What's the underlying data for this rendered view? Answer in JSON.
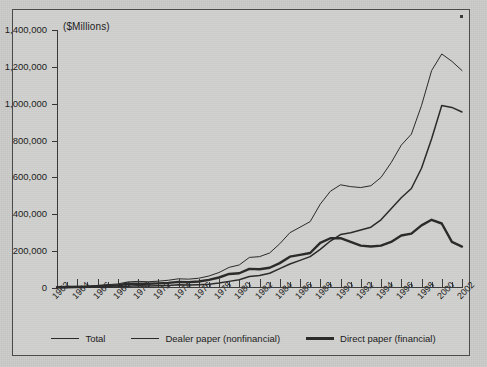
{
  "figure": {
    "background_color": "#cbcbc9",
    "frame_color": "#4b4b4b",
    "axis_color": "#3a3a3a",
    "line_color": "#2b2b2b"
  },
  "chart_data": {
    "type": "line",
    "title": "",
    "subtitle": "",
    "ylabel": "($Millions)",
    "xlabel": "",
    "grid": false,
    "legend_position": "bottom",
    "ylim": [
      0,
      1400000
    ],
    "ytick_values": [
      0,
      200000,
      400000,
      600000,
      800000,
      1000000,
      1200000,
      1400000
    ],
    "ytick_labels": [
      "0",
      "200,000",
      "400,000",
      "600,000",
      "800,000",
      "1,000,000",
      "1,200,000",
      "1,400,000"
    ],
    "xlim": [
      1962,
      2002
    ],
    "xtick_labels": [
      "1962",
      "1964",
      "1966",
      "1968",
      "1970",
      "1972",
      "1974",
      "1976",
      "1978",
      "1980",
      "1982",
      "1984",
      "1986",
      "1988",
      "1990",
      "1992",
      "1994",
      "1996",
      "1998",
      "2000",
      "2002"
    ],
    "x_minor_tick_interval": 1,
    "x": [
      1962,
      1963,
      1964,
      1965,
      1966,
      1967,
      1968,
      1969,
      1970,
      1971,
      1972,
      1973,
      1974,
      1975,
      1976,
      1977,
      1978,
      1979,
      1980,
      1981,
      1982,
      1983,
      1984,
      1985,
      1986,
      1987,
      1988,
      1989,
      1990,
      1991,
      1992,
      1993,
      1994,
      1995,
      1996,
      1997,
      1998,
      1999,
      2000,
      2001,
      2002
    ],
    "series": [
      {
        "name": "Total",
        "line_width": 1.0,
        "values": [
          7000,
          8000,
          9000,
          10000,
          14000,
          18000,
          22000,
          33000,
          36000,
          34000,
          37000,
          42000,
          50000,
          48000,
          53000,
          65000,
          84000,
          112000,
          125000,
          166000,
          170000,
          190000,
          240000,
          300000,
          330000,
          360000,
          455000,
          525000,
          560000,
          550000,
          545000,
          555000,
          600000,
          680000,
          775000,
          835000,
          990000,
          1180000,
          1270000,
          1230000,
          1180000
        ]
      },
      {
        "name": "Dealer paper (nonfinancial)",
        "line_width": 1.5,
        "values": [
          2000,
          2500,
          3000,
          3500,
          4500,
          6000,
          7000,
          10000,
          12000,
          11000,
          12000,
          14000,
          17000,
          16000,
          18000,
          21000,
          27000,
          36000,
          45000,
          62000,
          68000,
          80000,
          105000,
          130000,
          150000,
          170000,
          210000,
          255000,
          290000,
          300000,
          315000,
          330000,
          370000,
          430000,
          490000,
          540000,
          650000,
          810000,
          990000,
          980000,
          955000
        ]
      },
      {
        "name": "Direct paper (financial)",
        "line_width": 2.4,
        "values": [
          5000,
          5500,
          6000,
          6500,
          9500,
          12000,
          15000,
          23000,
          24000,
          23000,
          25000,
          28000,
          33000,
          32000,
          35000,
          44000,
          57000,
          76000,
          80000,
          104000,
          102000,
          110000,
          135000,
          170000,
          180000,
          190000,
          245000,
          270000,
          270000,
          250000,
          230000,
          225000,
          230000,
          250000,
          285000,
          295000,
          340000,
          370000,
          350000,
          250000,
          225000
        ]
      }
    ]
  },
  "legend": {
    "items": [
      {
        "label": "Total",
        "line_width": 1.0
      },
      {
        "label": "Dealer paper (nonfinancial)",
        "line_width": 1.6
      },
      {
        "label": "Direct paper (financial)",
        "line_width": 2.6
      }
    ]
  }
}
